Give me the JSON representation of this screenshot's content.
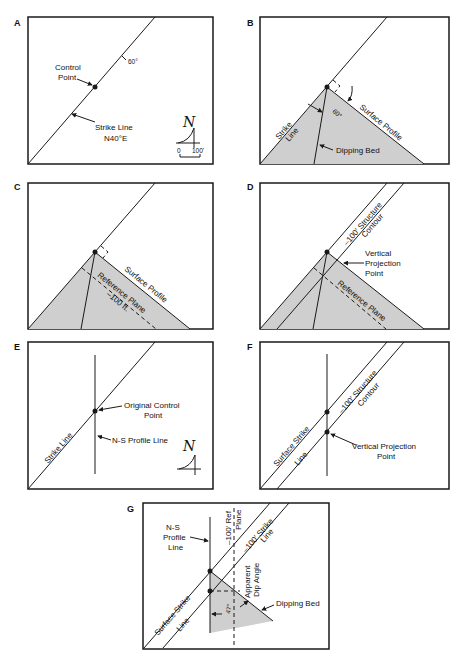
{
  "colors": {
    "line": "#1a1a1a",
    "shade": "#cfcfcf",
    "background": "#ffffff"
  },
  "panels": {
    "A": {
      "label": "A",
      "control_point_line1": "Control",
      "control_point_line2": "Point",
      "dip_label": "60°",
      "strike_line1": "Strike Line",
      "strike_line2": "N40°E",
      "north_symbol": "N",
      "scale_start": "0",
      "scale_end": "100'"
    },
    "B": {
      "label": "B",
      "strike_line1": "Strike",
      "strike_line2": "Line",
      "angle": "60°",
      "surface_profile": "Surface Profile",
      "dipping_bed": "Dipping Bed"
    },
    "C": {
      "label": "C",
      "surface_profile": "Surface Profile",
      "reference_plane": "Reference Plane",
      "depth": "–100 ft."
    },
    "D": {
      "label": "D",
      "contour_line1": "–100' Structure",
      "contour_line2": "Contour",
      "vpp_line1": "Vertical",
      "vpp_line2": "Projection",
      "vpp_line3": "Point",
      "reference_plane": "Reference Plane"
    },
    "E": {
      "label": "E",
      "strike_line": "Strike Line",
      "ocp_line1": "Original Control",
      "ocp_line2": "Point",
      "ns_profile": "N-S Profile Line",
      "north_symbol": "N"
    },
    "F": {
      "label": "F",
      "surface_strike1": "Surface Strike",
      "surface_strike2": "Line",
      "contour_line1": "–100' Structure",
      "contour_line2": "Contour",
      "vpp_line1": "Vertical Projection",
      "vpp_line2": "Point"
    },
    "G": {
      "label": "G",
      "ns_line1": "N-S",
      "ns_line2": "Profile",
      "ns_line3": "Line",
      "ref_plane1": "–100' Ref",
      "ref_plane2": "Plane",
      "strike1": "–100' Strike",
      "strike2": "Line",
      "apparent1": "Apparent",
      "apparent2": "Dip Angle",
      "angle": "47°",
      "dipping_bed": "Dipping Bed",
      "surface_strike1": "Surface Strike",
      "surface_strike2": "Line"
    }
  }
}
